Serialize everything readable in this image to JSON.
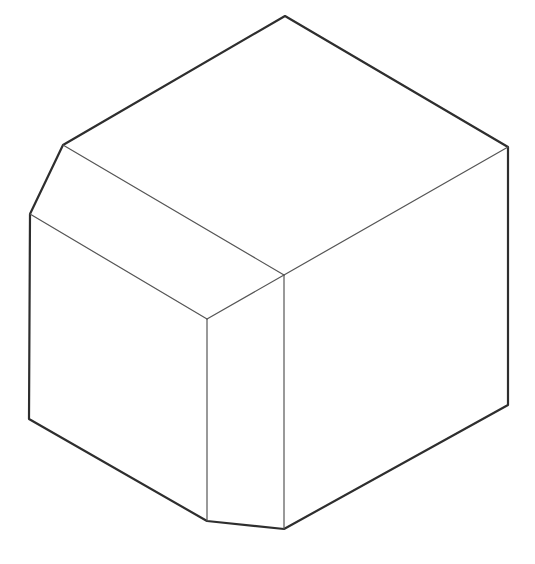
{
  "figure": {
    "background": "#ffffff",
    "outline_color": "#2e2e2e",
    "inner_line_color": "#555555",
    "vertices": {
      "A": [
        285,
        16
      ],
      "B": [
        63,
        145
      ],
      "C": [
        30,
        214
      ],
      "D": [
        29,
        419
      ],
      "E": [
        207,
        521
      ],
      "F": [
        284,
        529
      ],
      "G": [
        508,
        405
      ],
      "H": [
        508,
        147
      ],
      "I": [
        284,
        275
      ],
      "J": [
        207,
        319
      ]
    },
    "outline_path": [
      "A",
      "B",
      "C",
      "D",
      "E",
      "F",
      "G",
      "H",
      "A"
    ],
    "inner_edges": [
      [
        "B",
        "I"
      ],
      [
        "C",
        "J"
      ],
      [
        "J",
        "I"
      ],
      [
        "I",
        "H"
      ],
      [
        "I",
        "F"
      ],
      [
        "J",
        "E"
      ]
    ]
  }
}
